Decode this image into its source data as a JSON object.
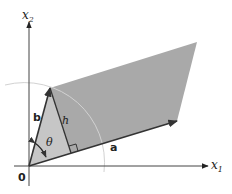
{
  "diagram": {
    "type": "parallelogram-area",
    "axes": {
      "x1_label": "x",
      "x1_sub": "1",
      "x2_label": "x",
      "x2_sub": "2",
      "origin_label": "0"
    },
    "vectors": {
      "a_label": "a",
      "b_label": "b"
    },
    "height_label": "h",
    "angle_label": "θ",
    "colors": {
      "parallelogram_fill": "#a9a9a9",
      "triangle_fill": "#c4c4c4",
      "vector_stroke": "#3a3a3a",
      "axis_stroke": "#444444",
      "arc_stroke": "#cfcfcf"
    }
  }
}
